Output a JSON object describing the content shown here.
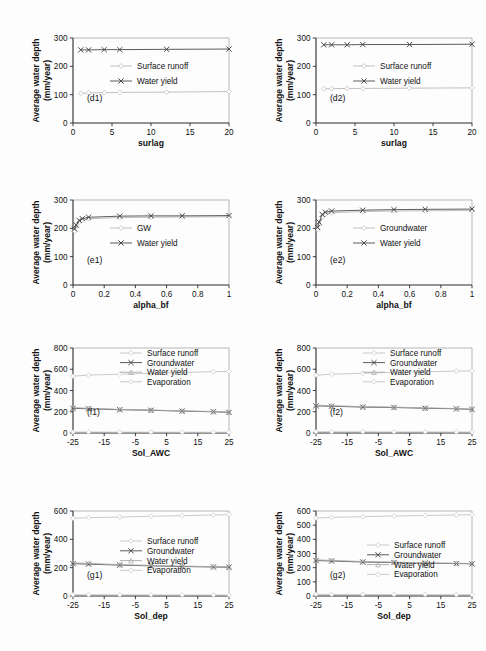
{
  "figure": {
    "axis_title_y": "Average water depth",
    "axis_title_y2": "(mm/year)"
  },
  "legend_labels": {
    "surface_runoff": "Surface runoff",
    "water_yield": "Water yield",
    "groundwater": "Groundwater",
    "gw_short": "GW",
    "evaporation": "Evaporation"
  },
  "chart_data": [
    {
      "id": "d1",
      "tag": "(d1)",
      "type": "line",
      "xlabel": "surlag",
      "ylabel": "Average water depth (mm/year)",
      "x": [
        1,
        2,
        4,
        6,
        12,
        20
      ],
      "xticks": [
        0,
        5,
        10,
        15,
        20
      ],
      "xlim": [
        0,
        20
      ],
      "yticks": [
        0,
        100,
        200,
        300
      ],
      "ylim": [
        0,
        300
      ],
      "grid": false,
      "legend_position": "center",
      "series": [
        {
          "name": "Surface runoff",
          "marker": "diamond",
          "color": "#b9b9b9",
          "values": [
            105,
            106,
            107,
            108,
            109,
            111
          ]
        },
        {
          "name": "Water yield",
          "marker": "cross",
          "color": "#4a4a4a",
          "values": [
            258,
            258,
            259,
            259,
            260,
            261
          ]
        }
      ]
    },
    {
      "id": "d2",
      "tag": "(d2)",
      "type": "line",
      "xlabel": "surlag",
      "ylabel": "Average water depth (mm/year)",
      "x": [
        1,
        2,
        4,
        6,
        12,
        20
      ],
      "xticks": [
        0,
        5,
        10,
        15,
        20
      ],
      "xlim": [
        0,
        20
      ],
      "yticks": [
        0,
        100,
        200,
        300
      ],
      "ylim": [
        0,
        300
      ],
      "grid": false,
      "legend_position": "center",
      "series": [
        {
          "name": "Surface runoff",
          "marker": "diamond",
          "color": "#b9b9b9",
          "values": [
            121,
            121,
            122,
            122,
            123,
            124
          ]
        },
        {
          "name": "Water yield",
          "marker": "cross",
          "color": "#4a4a4a",
          "values": [
            276,
            276,
            276,
            277,
            277,
            278
          ]
        }
      ]
    },
    {
      "id": "e1",
      "tag": "(e1)",
      "type": "line",
      "xlabel": "alpha_bf",
      "ylabel": "Average water depth (mm/year)",
      "x": [
        0.01,
        0.02,
        0.04,
        0.06,
        0.1,
        0.3,
        0.5,
        0.7,
        1.0
      ],
      "xticks": [
        0,
        0.2,
        0.4,
        0.6,
        0.8,
        1
      ],
      "xlim": [
        0,
        1
      ],
      "yticks": [
        0,
        100,
        200,
        300
      ],
      "ylim": [
        0,
        300
      ],
      "grid": false,
      "legend_position": "center",
      "series": [
        {
          "name": "GW",
          "marker": "diamond",
          "color": "#b9b9b9",
          "values": [
            190,
            205,
            222,
            228,
            234,
            238,
            239,
            240,
            241
          ]
        },
        {
          "name": "Water yield",
          "marker": "cross",
          "color": "#4a4a4a",
          "values": [
            198,
            212,
            228,
            234,
            239,
            243,
            244,
            244,
            245
          ]
        }
      ]
    },
    {
      "id": "e2",
      "tag": "(e2)",
      "type": "line",
      "xlabel": "alpha_bf",
      "ylabel": "Average water depth (mm/year)",
      "x": [
        0.01,
        0.02,
        0.04,
        0.06,
        0.1,
        0.3,
        0.5,
        0.7,
        1.0
      ],
      "xticks": [
        0,
        0.2,
        0.4,
        0.6,
        0.8,
        1
      ],
      "xlim": [
        0,
        1
      ],
      "yticks": [
        0,
        100,
        200,
        300
      ],
      "ylim": [
        0,
        300
      ],
      "grid": false,
      "legend_position": "center",
      "series": [
        {
          "name": "Groundwater",
          "marker": "diamond",
          "color": "#b9b9b9",
          "values": [
            196,
            212,
            240,
            249,
            255,
            259,
            261,
            262,
            263
          ]
        },
        {
          "name": "Water yield",
          "marker": "cross",
          "color": "#4a4a4a",
          "values": [
            203,
            222,
            249,
            257,
            261,
            264,
            266,
            267,
            268
          ]
        }
      ]
    },
    {
      "id": "f1",
      "tag": "(f1)",
      "type": "line",
      "xlabel": "Sol_AWC",
      "ylabel": "Average water depth (mm/year)",
      "x": [
        -25,
        -20,
        -10,
        0,
        10,
        20,
        25
      ],
      "xticks": [
        -25,
        -15,
        -5,
        5,
        15,
        25
      ],
      "xlim": [
        -25,
        25
      ],
      "yticks": [
        0,
        200,
        400,
        600,
        800
      ],
      "ylim": [
        0,
        800
      ],
      "grid": false,
      "legend_position": "top",
      "series": [
        {
          "name": "Surface runoff",
          "marker": "diamond",
          "color": "#c4c4c4",
          "values": [
            9,
            9,
            8,
            8,
            7,
            7,
            7
          ]
        },
        {
          "name": "Groundwater",
          "marker": "cross",
          "color": "#4a4a4a",
          "values": [
            232,
            228,
            219,
            214,
            206,
            200,
            194
          ]
        },
        {
          "name": "Water yield",
          "marker": "triangle",
          "color": "#a8a8a8",
          "values": [
            238,
            233,
            222,
            216,
            208,
            202,
            196
          ]
        },
        {
          "name": "Evaporation",
          "marker": "diamond",
          "color": "#c4c4c4",
          "values": [
            535,
            545,
            553,
            562,
            570,
            577,
            580
          ]
        }
      ]
    },
    {
      "id": "f2",
      "tag": "(f2)",
      "type": "line",
      "xlabel": "Sol_AWC",
      "ylabel": "Average water depth (mm/year)",
      "x": [
        -25,
        -20,
        -10,
        0,
        10,
        20,
        25
      ],
      "xticks": [
        -25,
        -15,
        -5,
        5,
        15,
        25
      ],
      "xlim": [
        -25,
        25
      ],
      "yticks": [
        0,
        200,
        400,
        600,
        800
      ],
      "ylim": [
        0,
        800
      ],
      "grid": false,
      "legend_position": "top",
      "series": [
        {
          "name": "Surface runoff",
          "marker": "diamond",
          "color": "#c4c4c4",
          "values": [
            12,
            11,
            11,
            10,
            10,
            9,
            9
          ]
        },
        {
          "name": "Groundwater",
          "marker": "cross",
          "color": "#4a4a4a",
          "values": [
            255,
            252,
            244,
            240,
            233,
            228,
            222
          ]
        },
        {
          "name": "Water yield",
          "marker": "triangle",
          "color": "#a8a8a8",
          "values": [
            262,
            257,
            248,
            243,
            236,
            230,
            224
          ]
        },
        {
          "name": "Evaporation",
          "marker": "diamond",
          "color": "#c4c4c4",
          "values": [
            544,
            553,
            562,
            570,
            576,
            582,
            585
          ]
        }
      ]
    },
    {
      "id": "g1",
      "tag": "(g1)",
      "type": "line",
      "xlabel": "Sol_dep",
      "ylabel": "Average water depth (mm/year)",
      "x": [
        -25,
        -20,
        -10,
        0,
        10,
        20,
        25
      ],
      "xticks": [
        -25,
        -15,
        -5,
        5,
        15,
        25
      ],
      "xlim": [
        -25,
        25
      ],
      "yticks": [
        0,
        200,
        400,
        600
      ],
      "ylim": [
        0,
        600
      ],
      "grid": false,
      "legend_position": "center",
      "series": [
        {
          "name": "Surface runoff",
          "marker": "diamond",
          "color": "#c4c4c4",
          "values": [
            9,
            9,
            8,
            8,
            7,
            7,
            7
          ]
        },
        {
          "name": "Groundwater",
          "marker": "cross",
          "color": "#4a4a4a",
          "values": [
            228,
            225,
            218,
            213,
            208,
            205,
            203
          ]
        },
        {
          "name": "Water yield",
          "marker": "triangle",
          "color": "#a8a8a8",
          "values": [
            234,
            230,
            221,
            216,
            211,
            207,
            205
          ]
        },
        {
          "name": "Evaporation",
          "marker": "diamond",
          "color": "#c4c4c4",
          "values": [
            548,
            553,
            557,
            563,
            567,
            572,
            574
          ]
        }
      ]
    },
    {
      "id": "g2",
      "tag": "(g2)",
      "type": "line",
      "xlabel": "Sol_dep",
      "ylabel": "Average water depth (mm/year)",
      "x": [
        -25,
        -20,
        -10,
        0,
        10,
        20,
        25
      ],
      "xticks": [
        -25,
        -15,
        -5,
        5,
        15,
        25
      ],
      "xlim": [
        -25,
        25
      ],
      "yticks": [
        0,
        100,
        200,
        300,
        400,
        500,
        600
      ],
      "ylim": [
        0,
        600
      ],
      "grid": false,
      "legend_position": "center",
      "series": [
        {
          "name": "Surface runoff",
          "marker": "diamond",
          "color": "#c4c4c4",
          "values": [
            12,
            11,
            11,
            10,
            10,
            9,
            9
          ]
        },
        {
          "name": "Groundwater",
          "marker": "cross",
          "color": "#4a4a4a",
          "values": [
            250,
            247,
            240,
            236,
            232,
            229,
            227
          ]
        },
        {
          "name": "Water yield",
          "marker": "triangle",
          "color": "#a8a8a8",
          "values": [
            255,
            251,
            243,
            239,
            234,
            231,
            229
          ]
        },
        {
          "name": "Evaporation",
          "marker": "diamond",
          "color": "#c4c4c4",
          "values": [
            550,
            555,
            560,
            565,
            568,
            572,
            574
          ]
        }
      ]
    }
  ]
}
